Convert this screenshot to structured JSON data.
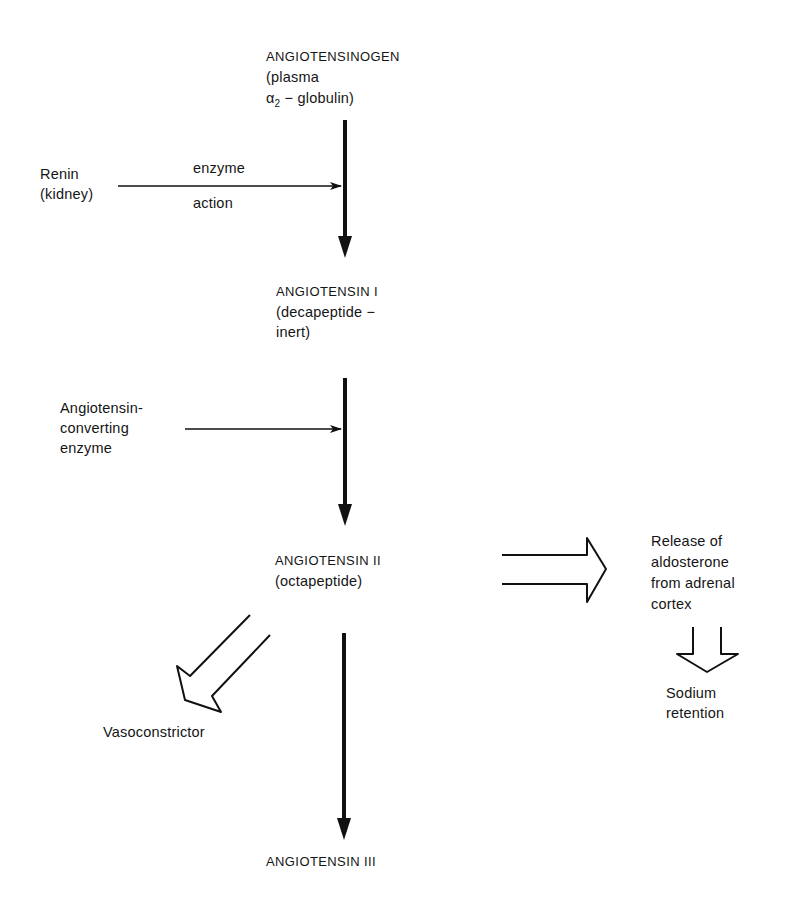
{
  "diagram": {
    "type": "flowchart",
    "title_fragment": "",
    "nodes": {
      "angiotensinogen": {
        "line1": "ANGIOTENSINOGEN",
        "line2": "(plasma",
        "line3_alpha": "α",
        "line3_sub": "2",
        "line3_rest": " − globulin)"
      },
      "renin": {
        "line1": "Renin",
        "line2": "(kidney)"
      },
      "renin_arrow_label": {
        "above": "enzyme",
        "below": "action"
      },
      "angiotensin_1": {
        "line1": "ANGIOTENSIN Ι",
        "line2": "(decapeptide −",
        "line3": "inert)"
      },
      "ace": {
        "line1": "Angiotensin-",
        "line2": "converting",
        "line3": "enzyme"
      },
      "angiotensin_2": {
        "line1": "ANGIOTENSIN ΙΙ",
        "line2": "(octapeptide)"
      },
      "aldosterone": {
        "line1": "Release of",
        "line2": "aldosterone",
        "line3": "from adrenal",
        "line4": "cortex"
      },
      "sodium": {
        "line1": "Sodium",
        "line2": "retention"
      },
      "vasoconstrictor": {
        "line1": "Vasoconstrictor"
      },
      "angiotensin_3": {
        "line1": "ANGIOTENSIN ΙΙΙ"
      }
    },
    "edges": [
      {
        "from": "angiotensinogen",
        "to": "angiotensin_1",
        "style": "solid-arrow"
      },
      {
        "from": "renin",
        "to": "angiotensinogen-to-angiotensin_1",
        "style": "thin-arrow",
        "label": "enzyme action"
      },
      {
        "from": "angiotensin_1",
        "to": "angiotensin_2",
        "style": "solid-arrow"
      },
      {
        "from": "ace",
        "to": "angiotensin_1-to-angiotensin_2",
        "style": "thin-arrow"
      },
      {
        "from": "angiotensin_2",
        "to": "aldosterone",
        "style": "hollow-arrow"
      },
      {
        "from": "aldosterone",
        "to": "sodium",
        "style": "hollow-arrow"
      },
      {
        "from": "angiotensin_2",
        "to": "vasoconstrictor",
        "style": "hollow-arrow"
      },
      {
        "from": "angiotensin_2",
        "to": "angiotensin_3",
        "style": "solid-arrow"
      }
    ],
    "colors": {
      "ink": "#111111",
      "background": "#ffffff"
    }
  }
}
